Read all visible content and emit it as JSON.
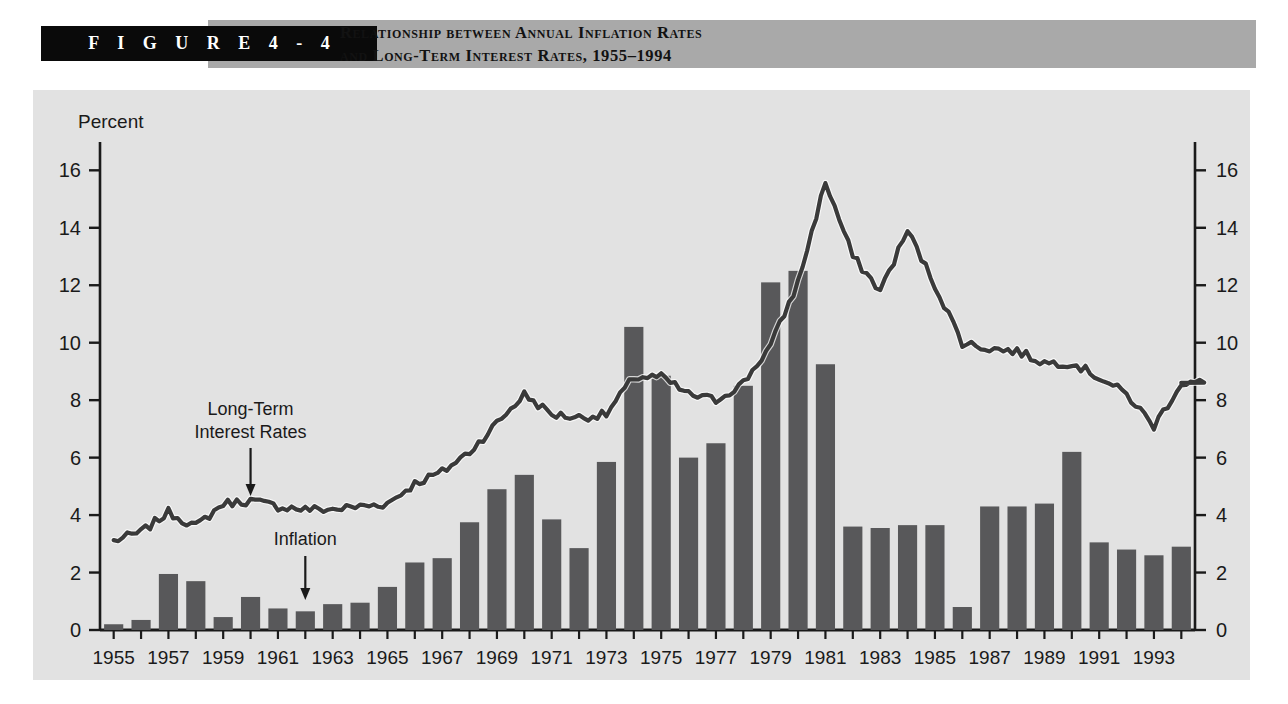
{
  "figure": {
    "badge": "F I G U R E    4 - 4",
    "title_line1": "Relationship between Annual Inflation Rates",
    "title_line2": "and Long-Term Interest Rates, 1955–1994"
  },
  "colors": {
    "page_background": "#ffffff",
    "badge_background": "#0a0a0a",
    "badge_text": "#ffffff",
    "title_band": "#a9a9a9",
    "panel_background": "#e2e2e2",
    "bar_fill": "#58585a",
    "line_stroke": "#3a3a3a",
    "axis": "#1a1a1a",
    "text": "#1a1a1a"
  },
  "chart_data": {
    "type": "bar",
    "xlabel": "",
    "ylabel": "Percent",
    "ylim": [
      0,
      17
    ],
    "yticks": [
      0,
      2,
      4,
      6,
      8,
      10,
      12,
      14,
      16
    ],
    "ytick_labels": [
      "0",
      "2",
      "4",
      "6",
      "8",
      "10",
      "12",
      "14",
      "16"
    ],
    "right_axis": true,
    "right_ytick_labels": [
      "0",
      "2",
      "4",
      "6",
      "8",
      "10",
      "12",
      "14",
      "16"
    ],
    "grid": false,
    "legend": "annotations",
    "x_axis_label_text": "Percent",
    "categories": [
      1955,
      1956,
      1957,
      1958,
      1959,
      1960,
      1961,
      1962,
      1963,
      1964,
      1965,
      1966,
      1967,
      1968,
      1969,
      1970,
      1971,
      1972,
      1973,
      1974,
      1975,
      1976,
      1977,
      1978,
      1979,
      1980,
      1981,
      1982,
      1983,
      1984,
      1985,
      1986,
      1987,
      1988,
      1989,
      1990,
      1991,
      1992,
      1993,
      1994
    ],
    "xtick_labels": [
      "1955",
      "1957",
      "1959",
      "1961",
      "1963",
      "1965",
      "1967",
      "1969",
      "1971",
      "1973",
      "1975",
      "1977",
      "1979",
      "1981",
      "1983",
      "1985",
      "1987",
      "1989",
      "1991",
      "1993"
    ],
    "series": [
      {
        "name": "Inflation",
        "type": "bar",
        "values": [
          0.2,
          0.35,
          1.95,
          1.7,
          0.45,
          1.15,
          0.75,
          0.65,
          0.9,
          0.95,
          1.5,
          2.35,
          2.5,
          3.75,
          4.9,
          5.4,
          3.85,
          2.85,
          5.85,
          10.55,
          8.85,
          6.0,
          6.5,
          8.5,
          12.1,
          12.5,
          9.25,
          3.6,
          3.55,
          3.65,
          3.65,
          0.8,
          4.3,
          4.3,
          4.4,
          6.2,
          3.05,
          2.8,
          2.6,
          2.9
        ]
      },
      {
        "name": "Long-Term Interest Rates",
        "type": "line",
        "values": [
          3.1,
          3.4,
          4.1,
          3.6,
          4.4,
          4.5,
          4.3,
          4.2,
          4.2,
          4.3,
          4.4,
          5.1,
          5.5,
          6.2,
          7.2,
          8.2,
          7.5,
          7.4,
          7.5,
          8.8,
          8.8,
          8.2,
          8.0,
          8.6,
          9.9,
          12.1,
          15.6,
          13.0,
          11.8,
          13.9,
          12.0,
          10.0,
          9.8,
          9.7,
          9.3,
          9.3,
          8.8,
          8.2,
          7.1,
          8.6
        ]
      }
    ],
    "annotations": [
      {
        "text_line1": "Long-Term",
        "text_line2": "Interest Rates",
        "points_to": "line",
        "at_year": 1960
      },
      {
        "text_line1": "Inflation",
        "text_line2": "",
        "points_to": "bar",
        "at_year": 1962
      }
    ]
  }
}
